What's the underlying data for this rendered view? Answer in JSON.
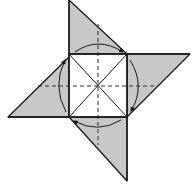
{
  "diagram": {
    "step_mark": "",
    "colors": {
      "paper_fill": "#c8c8c8",
      "paper_white": "#ffffff",
      "line": "#1a1a1a",
      "dashed": "#2a2a2a"
    },
    "center_square": {
      "x1": 69,
      "y1": 54,
      "x2": 127,
      "y2": 117,
      "center": [
        98,
        86
      ]
    },
    "flaps": [
      {
        "name": "top",
        "points": "69,0 69,54 127,54"
      },
      {
        "name": "right",
        "points": "127,54 190,54 127,117"
      },
      {
        "name": "bottom",
        "points": "127,117 127,181 69,117"
      },
      {
        "name": "left",
        "points": "69,117 8,117 69,57"
      }
    ],
    "arrows": [
      {
        "name": "top-arrow",
        "direction": "clockwise"
      },
      {
        "name": "right-arrow",
        "direction": "clockwise"
      },
      {
        "name": "bottom-arrow",
        "direction": "clockwise"
      },
      {
        "name": "left-arrow",
        "direction": "clockwise"
      }
    ],
    "fold_lines": {
      "valley_dashed": [
        "vertical",
        "horizontal"
      ],
      "creases": [
        "diagonal-1",
        "diagonal-2"
      ]
    }
  }
}
